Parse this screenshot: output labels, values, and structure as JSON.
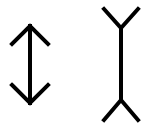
{
  "figure": {
    "background": "#ffffff",
    "stroke_color": "#000000",
    "stroke_width": 4,
    "left_figure": {
      "name": "arrowheads-inward",
      "shaft": {
        "x": 30,
        "y1": 26,
        "y2": 103
      },
      "top_fins": [
        [
          12,
          44
        ],
        [
          30,
          26
        ],
        [
          48,
          44
        ]
      ],
      "bottom_fins": [
        [
          12,
          85
        ],
        [
          30,
          103
        ],
        [
          48,
          85
        ]
      ]
    },
    "right_figure": {
      "name": "arrowheads-outward",
      "shaft": {
        "x": 121,
        "y1": 28,
        "y2": 100
      },
      "top_fins": [
        [
          104,
          9
        ],
        [
          121,
          28
        ],
        [
          138,
          9
        ]
      ],
      "bottom_fins": [
        [
          104,
          120
        ],
        [
          121,
          100
        ],
        [
          138,
          120
        ]
      ]
    }
  }
}
